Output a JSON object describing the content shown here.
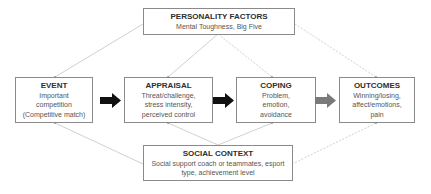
{
  "personality": {
    "title": "PERSONALITY FACTORS",
    "lines": [
      "Mental Toughness, Big Five"
    ]
  },
  "event": {
    "title": "EVENT",
    "lines": [
      "Important",
      "competition",
      "(Competitive match)"
    ]
  },
  "appraisal": {
    "title": "APPRAISAL",
    "lines": [
      "Threat/challenge,",
      "stress intensity,",
      "perceived control"
    ]
  },
  "coping": {
    "title": "COPING",
    "lines": [
      "Problem,",
      "emotion,",
      "avoidance"
    ]
  },
  "outcomes": {
    "title": "OUTCOMES",
    "lines": [
      "Winning/losing,",
      "affect/emotions,",
      "pain"
    ]
  },
  "social": {
    "title": "SOCIAL CONTEXT",
    "lines": [
      "Social support coach or teammates, esport",
      "type, achievement level"
    ]
  },
  "colors": {
    "box_border": "#8a8a8a",
    "connector": "#c4c4c4",
    "arrow_dark": "#111111",
    "arrow_gray": "#7a7a7a"
  }
}
